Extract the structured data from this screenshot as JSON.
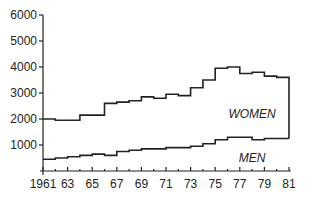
{
  "chart_data": {
    "type": "line",
    "step": true,
    "title": "",
    "xlabel": "",
    "ylabel": "",
    "ylim": [
      0,
      6000
    ],
    "xlim": [
      1961,
      1981
    ],
    "yticks": [
      1000,
      2000,
      3000,
      4000,
      5000,
      6000
    ],
    "ytick_labels": [
      "1000",
      "2000",
      "3000",
      "4000",
      "5000",
      "6000"
    ],
    "xticks": [
      1961,
      1963,
      1965,
      1967,
      1969,
      1971,
      1973,
      1975,
      1977,
      1979,
      1981
    ],
    "xtick_labels": [
      "1961",
      "63",
      "65",
      "67",
      "69",
      "71",
      "73",
      "75",
      "77",
      "79",
      "81"
    ],
    "grid": false,
    "legend": "inline labels",
    "x": [
      1961,
      1962,
      1963,
      1964,
      1965,
      1966,
      1967,
      1968,
      1969,
      1970,
      1971,
      1972,
      1973,
      1974,
      1975,
      1976,
      1977,
      1978,
      1979,
      1980
    ],
    "series": [
      {
        "name": "WOMEN",
        "values": [
          2000,
          1950,
          1950,
          2150,
          2150,
          2600,
          2650,
          2700,
          2850,
          2800,
          2950,
          2900,
          3200,
          3500,
          3950,
          4000,
          3750,
          3800,
          3650,
          3600
        ]
      },
      {
        "name": "MEN",
        "values": [
          450,
          500,
          550,
          600,
          650,
          600,
          750,
          800,
          850,
          850,
          900,
          900,
          950,
          1050,
          1200,
          1300,
          1300,
          1200,
          1250,
          1250
        ]
      }
    ],
    "annotations": [
      {
        "text": "WOMEN",
        "x": 1978,
        "y": 2200
      },
      {
        "text": "MEN",
        "x": 1978,
        "y": 500
      }
    ]
  }
}
